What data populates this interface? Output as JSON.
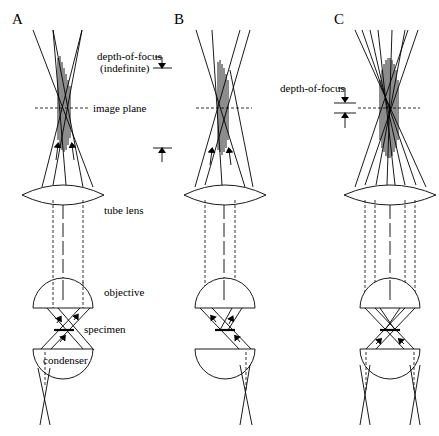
{
  "figure": {
    "panels": [
      {
        "id": "A",
        "label": "A"
      },
      {
        "id": "B",
        "label": "B"
      },
      {
        "id": "C",
        "label": "C"
      }
    ],
    "annotations": {
      "depth_of_focus_indefinite_line1": "depth-of-focus",
      "depth_of_focus_indefinite_line2": "(indefinite)",
      "image_plane": "image plane",
      "tube_lens": "tube lens",
      "objective": "objective",
      "specimen": "specimen",
      "condenser": "condenser",
      "depth_of_focus": "depth-of-focus"
    },
    "components": [
      "image plane",
      "tube lens",
      "objective",
      "specimen",
      "condenser"
    ]
  }
}
